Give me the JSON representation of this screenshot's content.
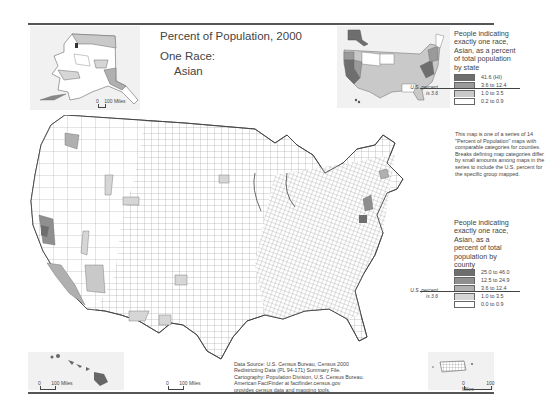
{
  "header": {
    "title": "Percent of Population, 2000",
    "subtitle_line1": "One Race:",
    "subtitle_line2": "Asian"
  },
  "state_legend": {
    "heading": [
      "People indicating",
      "exactly one race,",
      "Asian, as a percent",
      "of total population",
      "by state"
    ],
    "classes": [
      {
        "label": "41.6 (HI)",
        "color": "#6e6e6e"
      },
      {
        "label": "3.6 to 12.4",
        "color": "#9a9a9a"
      },
      {
        "label": "1.0 to 3.5",
        "color": "#c9c9c9"
      },
      {
        "label": "0.2 to 0.9",
        "color": "#ffffff"
      }
    ],
    "us_percent_label": [
      "U.S. percent",
      "is 3.6"
    ]
  },
  "series_note": "This map is one of a series of 14 \"Percent of Population\" maps with comparable categories for counties. Breaks defining map categories differ by small amounts among maps in the series to include the U.S. percent for the specific group mapped.",
  "county_legend": {
    "heading": [
      "People indicating",
      "exactly one race,",
      "Asian, as a",
      "percent of total",
      "population by",
      "county"
    ],
    "classes": [
      {
        "label": "25.0 to 46.0",
        "color": "#6e6e6e"
      },
      {
        "label": "12.5 to 24.9",
        "color": "#8f8f8f"
      },
      {
        "label": "3.6 to 12.4",
        "color": "#b0b0b0"
      },
      {
        "label": "1.0 to 3.5",
        "color": "#d6d6d6"
      },
      {
        "label": "0.0 to 0.9",
        "color": "#ffffff"
      }
    ],
    "us_percent_label": [
      "U.S. percent",
      "is 3.6"
    ]
  },
  "scales": {
    "alaska": {
      "zero": "0",
      "label": "100 Miles"
    },
    "hawaii": {
      "zero": "0",
      "label": "100 Miles"
    },
    "conus": {
      "zero": "0",
      "label": "100 Miles"
    },
    "puerto_rico": {
      "zero": "0",
      "label": "100 Miles"
    }
  },
  "source": [
    "Data Source: U.S. Census Bureau, Census 2000",
    "Redistricting Data (PL 94-171) Summary File.",
    "Cartography: Population Division, U.S. Census Bureau.",
    "American FactFinder at factfinder.census.gov",
    "provides census data and mapping tools."
  ],
  "colors": {
    "rule": "#555555",
    "inset_bg": "#f1f1f1",
    "county_border": "#777777"
  }
}
